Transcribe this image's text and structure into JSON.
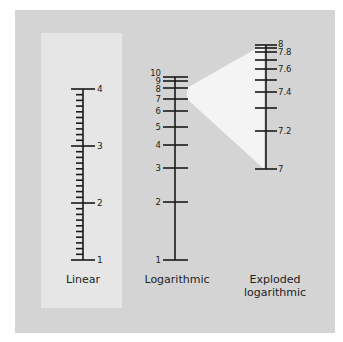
{
  "colors": {
    "page_bg": "#ffffff",
    "panel_bg": "#d4d4d4",
    "highlight_bg": "#e6e6e6",
    "wedge_fill": "#f4f4f4",
    "ink": "#1a1a1a"
  },
  "scales": {
    "linear": {
      "caption": "Linear",
      "major_labels": [
        "1",
        "2",
        "3",
        "4"
      ],
      "minor_divisions_per_unit": 10
    },
    "logarithmic": {
      "caption": "Logarithmic",
      "labels": [
        "1",
        "2",
        "3",
        "4",
        "5",
        "6",
        "7",
        "8",
        "9",
        "10"
      ]
    },
    "exploded": {
      "caption_line1": "Exploded",
      "caption_line2": "logarithmic",
      "labels": [
        "7",
        "7.2",
        "7.4",
        "7.6",
        "7.8",
        "8"
      ],
      "range": [
        7,
        8
      ]
    }
  }
}
